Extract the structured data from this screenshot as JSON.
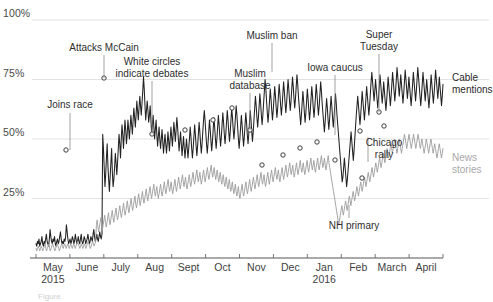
{
  "chart_data": {
    "type": "line",
    "title": "",
    "subtitle": "",
    "xlabel": "",
    "ylabel": "",
    "ylim": [
      0,
      100
    ],
    "ytick_labels": [
      "100%",
      "75%",
      "50%",
      "25%"
    ],
    "ytick_values": [
      100,
      75,
      50,
      25
    ],
    "grid": true,
    "legend_position": "right-inline",
    "xtick_labels": [
      {
        "label": "May",
        "sub": "2015"
      },
      {
        "label": "June",
        "sub": ""
      },
      {
        "label": "July",
        "sub": ""
      },
      {
        "label": "Aug",
        "sub": ""
      },
      {
        "label": "Sept",
        "sub": ""
      },
      {
        "label": "Oct",
        "sub": ""
      },
      {
        "label": "Nov",
        "sub": ""
      },
      {
        "label": "Dec",
        "sub": ""
      },
      {
        "label": "Jan",
        "sub": "2016"
      },
      {
        "label": "Feb",
        "sub": ""
      },
      {
        "label": "March",
        "sub": ""
      },
      {
        "label": "April",
        "sub": ""
      }
    ],
    "series": [
      {
        "name": "Cable mentions",
        "color": "#222222",
        "values": [
          6,
          5,
          7,
          6,
          8,
          5,
          6,
          7,
          9,
          6,
          5,
          7,
          6,
          8,
          10,
          7,
          6,
          5,
          8,
          12,
          9,
          7,
          6,
          8,
          7,
          9,
          6,
          5,
          7,
          8,
          6,
          7,
          9,
          11,
          8,
          6,
          7,
          6,
          8,
          7,
          9,
          14,
          11,
          8,
          6,
          7,
          8,
          6,
          7,
          9,
          8,
          6,
          7,
          10,
          8,
          6,
          7,
          9,
          7,
          6,
          8,
          10,
          7,
          6,
          7,
          9,
          8,
          6,
          7,
          8,
          10,
          8,
          6,
          7,
          9,
          8,
          7,
          10,
          12,
          9,
          7,
          8,
          10,
          8,
          7,
          9,
          11,
          9,
          8,
          10,
          52,
          46,
          38,
          30,
          35,
          42,
          48,
          39,
          33,
          28,
          34,
          40,
          46,
          36,
          30,
          33,
          38,
          44,
          40,
          35,
          40,
          46,
          52,
          48,
          42,
          50,
          56,
          52,
          46,
          52,
          58,
          54,
          48,
          52,
          58,
          54,
          50,
          55,
          60,
          56,
          52,
          58,
          63,
          59,
          55,
          60,
          66,
          62,
          58,
          63,
          68,
          64,
          60,
          65,
          70,
          76,
          71,
          64,
          58,
          62,
          66,
          62,
          57,
          60,
          64,
          58,
          52,
          56,
          60,
          55,
          50,
          54,
          58,
          52,
          47,
          51,
          55,
          50,
          46,
          50,
          54,
          49,
          44,
          48,
          52,
          48,
          44,
          48,
          53,
          49,
          45,
          50,
          55,
          51,
          47,
          52,
          57,
          53,
          49,
          54,
          59,
          55,
          50,
          45,
          49,
          53,
          48,
          43,
          47,
          51,
          46,
          42,
          46,
          50,
          46,
          42,
          46,
          50,
          55,
          51,
          46,
          42,
          46,
          51,
          56,
          52,
          47,
          43,
          47,
          52,
          57,
          53,
          48,
          44,
          48,
          53,
          58,
          62,
          58,
          53,
          48,
          44,
          48,
          53,
          58,
          54,
          49,
          45,
          49,
          54,
          59,
          55,
          50,
          46,
          50,
          55,
          60,
          56,
          51,
          47,
          51,
          56,
          61,
          57,
          52,
          48,
          52,
          57,
          62,
          58,
          53,
          49,
          53,
          58,
          63,
          59,
          54,
          50,
          54,
          59,
          64,
          60,
          55,
          50,
          46,
          50,
          55,
          60,
          56,
          51,
          47,
          51,
          56,
          61,
          57,
          52,
          48,
          52,
          57,
          62,
          58,
          53,
          49,
          53,
          58,
          63,
          68,
          64,
          59,
          55,
          59,
          64,
          69,
          65,
          60,
          56,
          60,
          65,
          70,
          75,
          71,
          66,
          61,
          57,
          61,
          66,
          71,
          67,
          62,
          58,
          62,
          67,
          72,
          68,
          63,
          59,
          63,
          68,
          73,
          69,
          64,
          60,
          64,
          69,
          74,
          70,
          65,
          61,
          65,
          70,
          75,
          71,
          66,
          62,
          66,
          71,
          76,
          72,
          67,
          63,
          67,
          72,
          77,
          73,
          68,
          64,
          60,
          56,
          60,
          65,
          70,
          66,
          61,
          57,
          61,
          66,
          71,
          67,
          62,
          58,
          62,
          67,
          72,
          68,
          63,
          59,
          63,
          68,
          73,
          69,
          64,
          60,
          64,
          69,
          74,
          70,
          65,
          61,
          57,
          53,
          57,
          62,
          67,
          63,
          58,
          54,
          58,
          63,
          68,
          64,
          59,
          55,
          59,
          64,
          69,
          65,
          60,
          56,
          52,
          48,
          44,
          40,
          36,
          32,
          34,
          38,
          42,
          38,
          34,
          30,
          33,
          37,
          41,
          45,
          49,
          53,
          49,
          45,
          41,
          45,
          50,
          55,
          60,
          64,
          68,
          64,
          60,
          56,
          60,
          65,
          70,
          66,
          62,
          58,
          62,
          67,
          72,
          68,
          64,
          60,
          64,
          69,
          74,
          78,
          74,
          70,
          66,
          70,
          75,
          71,
          67,
          63,
          67,
          72,
          77,
          73,
          69,
          65,
          69,
          74,
          70,
          66,
          62,
          66,
          71,
          76,
          72,
          68,
          64,
          68,
          73,
          78,
          74,
          70,
          66,
          70,
          75,
          80,
          76,
          72,
          68,
          72,
          77,
          73,
          69,
          65,
          69,
          74,
          79,
          75,
          71,
          67,
          71,
          76,
          72,
          68,
          64,
          68,
          73,
          78,
          74,
          70,
          66,
          70,
          75,
          80,
          76,
          72,
          68,
          64,
          68,
          73,
          78,
          74,
          70,
          66,
          70,
          75,
          71,
          67,
          63,
          67,
          72,
          77,
          73,
          69,
          65,
          69,
          74,
          79,
          75,
          71,
          67,
          71,
          76,
          72,
          68,
          64,
          68,
          73
        ]
      },
      {
        "name": "News stories",
        "color": "#a0a0a0",
        "values": [
          4,
          3,
          4,
          5,
          4,
          3,
          4,
          5,
          4,
          3,
          4,
          5,
          6,
          4,
          3,
          4,
          5,
          6,
          4,
          3,
          4,
          5,
          6,
          5,
          4,
          3,
          4,
          5,
          6,
          5,
          4,
          3,
          4,
          5,
          6,
          5,
          4,
          5,
          6,
          5,
          4,
          5,
          6,
          5,
          4,
          5,
          6,
          5,
          4,
          5,
          6,
          5,
          4,
          5,
          6,
          7,
          6,
          5,
          4,
          5,
          6,
          5,
          4,
          5,
          6,
          5,
          4,
          5,
          6,
          7,
          6,
          5,
          4,
          5,
          6,
          7,
          6,
          5,
          6,
          7,
          14,
          16,
          13,
          11,
          13,
          15,
          17,
          14,
          12,
          14,
          16,
          18,
          15,
          13,
          15,
          17,
          19,
          16,
          14,
          16,
          18,
          20,
          17,
          15,
          17,
          19,
          21,
          18,
          16,
          18,
          20,
          22,
          19,
          17,
          19,
          21,
          23,
          20,
          18,
          20,
          22,
          24,
          21,
          19,
          21,
          23,
          25,
          22,
          20,
          22,
          24,
          26,
          23,
          21,
          23,
          25,
          27,
          24,
          22,
          24,
          26,
          28,
          25,
          23,
          25,
          27,
          29,
          26,
          24,
          26,
          28,
          30,
          27,
          25,
          27,
          29,
          31,
          28,
          26,
          28,
          30,
          27,
          25,
          27,
          29,
          31,
          28,
          26,
          28,
          30,
          32,
          29,
          27,
          29,
          31,
          33,
          30,
          28,
          30,
          32,
          29,
          27,
          29,
          31,
          33,
          30,
          28,
          30,
          32,
          34,
          31,
          29,
          31,
          33,
          35,
          32,
          30,
          32,
          34,
          31,
          29,
          31,
          33,
          35,
          32,
          30,
          32,
          34,
          36,
          33,
          31,
          33,
          35,
          37,
          34,
          32,
          34,
          36,
          33,
          31,
          33,
          35,
          37,
          34,
          32,
          34,
          36,
          38,
          35,
          33,
          35,
          37,
          39,
          36,
          34,
          36,
          38,
          35,
          33,
          35,
          37,
          34,
          32,
          34,
          36,
          33,
          31,
          33,
          35,
          32,
          30,
          32,
          34,
          31,
          29,
          31,
          33,
          30,
          28,
          30,
          32,
          29,
          27,
          29,
          31,
          28,
          26,
          28,
          30,
          27,
          25,
          27,
          29,
          31,
          28,
          26,
          28,
          30,
          32,
          29,
          27,
          29,
          31,
          33,
          30,
          28,
          30,
          32,
          34,
          31,
          29,
          31,
          33,
          35,
          32,
          30,
          32,
          34,
          36,
          33,
          31,
          33,
          35,
          32,
          30,
          32,
          34,
          36,
          33,
          31,
          33,
          35,
          37,
          34,
          32,
          34,
          36,
          38,
          35,
          33,
          35,
          37,
          34,
          32,
          34,
          36,
          38,
          35,
          33,
          35,
          37,
          39,
          36,
          34,
          36,
          38,
          40,
          37,
          35,
          37,
          39,
          36,
          34,
          36,
          38,
          40,
          37,
          35,
          37,
          39,
          41,
          38,
          36,
          38,
          40,
          37,
          35,
          37,
          39,
          41,
          38,
          36,
          38,
          40,
          42,
          39,
          37,
          39,
          41,
          38,
          36,
          38,
          40,
          42,
          39,
          37,
          39,
          41,
          43,
          40,
          38,
          40,
          42,
          39,
          37,
          39,
          41,
          43,
          40,
          38,
          36,
          34,
          32,
          30,
          28,
          26,
          24,
          22,
          20,
          18,
          16,
          14,
          16,
          18,
          20,
          22,
          20,
          18,
          20,
          22,
          24,
          22,
          20,
          22,
          24,
          26,
          24,
          22,
          24,
          26,
          28,
          26,
          24,
          26,
          28,
          30,
          28,
          26,
          28,
          30,
          32,
          30,
          28,
          30,
          32,
          34,
          32,
          30,
          32,
          34,
          36,
          34,
          32,
          34,
          36,
          38,
          36,
          34,
          36,
          38,
          40,
          38,
          36,
          38,
          40,
          42,
          40,
          38,
          40,
          42,
          44,
          42,
          40,
          42,
          44,
          46,
          44,
          42,
          44,
          46,
          48,
          46,
          44,
          46,
          48,
          50,
          48,
          46,
          44,
          46,
          48,
          50,
          48,
          46,
          44,
          46,
          48,
          50,
          52,
          50,
          48,
          46,
          48,
          50,
          52,
          50,
          48,
          46,
          48,
          50,
          52,
          50,
          48,
          46,
          48,
          50,
          52,
          50,
          48,
          46,
          48,
          50,
          48,
          46,
          44,
          46,
          48,
          50,
          48,
          46,
          44,
          46,
          48,
          50,
          48,
          46,
          44,
          46,
          48,
          46,
          44,
          42,
          44,
          46,
          48,
          46,
          44,
          42,
          44,
          46
        ]
      }
    ],
    "annotations": [
      {
        "id": "joins-race",
        "text": "Joins race",
        "align": "center",
        "x_px": 70,
        "y_px": 99,
        "leader_x": 70,
        "leader_y1": 113,
        "leader_y2": 150
      },
      {
        "id": "attacks-mccain",
        "text": "Attacks McCain",
        "align": "center",
        "x_px": 104,
        "y_px": 42,
        "leader_x": 104,
        "leader_y1": 55,
        "leader_y2": 78
      },
      {
        "id": "white-circles-debates",
        "text": "White circles\nindicate debates",
        "align": "center",
        "x_px": 152,
        "y_px": 56,
        "leader_x": 152,
        "leader_y1": 81,
        "leader_y2": 134
      },
      {
        "id": "muslim-database",
        "text": "Muslim\ndatabase",
        "align": "center",
        "x_px": 250,
        "y_px": 68,
        "leader_x": 250,
        "leader_y1": 93,
        "leader_y2": 130
      },
      {
        "id": "muslim-ban",
        "text": "Muslim ban",
        "align": "center",
        "x_px": 272,
        "y_px": 30,
        "leader_x": 272,
        "leader_y1": 43,
        "leader_y2": 72
      },
      {
        "id": "iowa-caucus",
        "text": "Iowa caucus",
        "align": "center",
        "x_px": 335,
        "y_px": 62,
        "leader_x": 335,
        "leader_y1": 75,
        "leader_y2": 135
      },
      {
        "id": "super-tuesday",
        "text": "Super\nTuesday",
        "align": "center",
        "x_px": 379,
        "y_px": 29,
        "leader_x": 379,
        "leader_y1": 54,
        "leader_y2": 112
      },
      {
        "id": "chicago-rally",
        "text": "Chicago\nrally",
        "align": "center",
        "x_px": 384,
        "y_px": 137,
        "leader_x": 368,
        "leader_y1": 137,
        "leader_y2": 162
      },
      {
        "id": "nh-primary",
        "text": "NH primary",
        "align": "center",
        "x_px": 354,
        "y_px": 220,
        "leader_x": 349,
        "leader_y1": 205,
        "leader_y2": 218
      }
    ],
    "series_labels": [
      {
        "id": "cable-mentions",
        "text": "Cable\nmentions",
        "x_px": 452,
        "y_px": 72
      },
      {
        "id": "news-stories",
        "text": "News\nstories",
        "x_px": 452,
        "y_px": 152
      }
    ],
    "debate_markers_cable": [
      {
        "x_px": 104,
        "y_px": 78
      },
      {
        "x_px": 152,
        "y_px": 134
      },
      {
        "x_px": 185,
        "y_px": 130
      },
      {
        "x_px": 232,
        "y_px": 108
      },
      {
        "x_px": 250,
        "y_px": 130
      },
      {
        "x_px": 262,
        "y_px": 165
      },
      {
        "x_px": 283,
        "y_px": 155
      },
      {
        "x_px": 300,
        "y_px": 148
      },
      {
        "x_px": 317,
        "y_px": 142
      },
      {
        "x_px": 335,
        "y_px": 160
      },
      {
        "x_px": 360,
        "y_px": 131
      },
      {
        "x_px": 379,
        "y_px": 112
      },
      {
        "x_px": 384,
        "y_px": 126
      },
      {
        "x_px": 362,
        "y_px": 178
      },
      {
        "x_px": 66,
        "y_px": 150
      },
      {
        "x_px": 213,
        "y_px": 120
      }
    ],
    "figure_caption": "Figure"
  },
  "axis": {
    "left_px": 36,
    "right_px": 443,
    "top_px": 20,
    "bottom_px": 258
  }
}
